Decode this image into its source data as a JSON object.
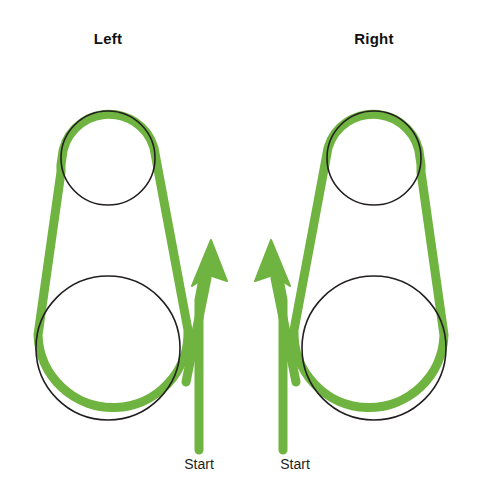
{
  "figure": {
    "kind": "belt-routing-diagram",
    "background_color": "#ffffff",
    "belt_color": "#6FB340",
    "pulley_outline_color": "#231f20",
    "text_color": "#231f20"
  },
  "panels": [
    {
      "id": "left",
      "title": "Left",
      "start_label": "Start",
      "arrow_direction": "up",
      "pulleys": [
        {
          "name": "upper-small-pulley",
          "cx": 108,
          "cy": 158,
          "r": 47
        },
        {
          "name": "lower-large-pulley",
          "cx": 108,
          "cy": 348,
          "r": 72
        }
      ],
      "start_point": {
        "x": 199,
        "y": 450
      },
      "arrow_tip": {
        "x": 211,
        "y": 240
      }
    },
    {
      "id": "right",
      "title": "Right",
      "start_label": "Start",
      "arrow_direction": "up",
      "pulleys": [
        {
          "name": "upper-small-pulley",
          "cx": 374,
          "cy": 158,
          "r": 47
        },
        {
          "name": "lower-large-pulley",
          "cx": 374,
          "cy": 348,
          "r": 72
        }
      ],
      "start_point": {
        "x": 283,
        "y": 450
      },
      "arrow_tip": {
        "x": 271,
        "y": 240
      }
    }
  ]
}
